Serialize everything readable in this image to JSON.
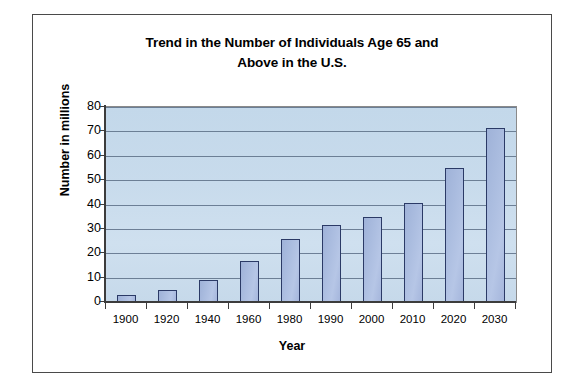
{
  "chart_data": {
    "type": "bar",
    "title": "Trend in the Number of Individuals Age 65 and Above in the U.S.",
    "title_line1": "Trend in the Number of Individuals Age 65 and",
    "title_line2": "Above in the U.S.",
    "xlabel": "Year",
    "ylabel": "Number in millions",
    "categories": [
      "1900",
      "1920",
      "1940",
      "1960",
      "1980",
      "1990",
      "2000",
      "2010",
      "2020",
      "2030"
    ],
    "values": [
      3,
      5,
      9,
      17,
      26,
      31.5,
      35,
      40.5,
      55,
      71.5
    ],
    "ylim": [
      0,
      80
    ],
    "ytick_labels": [
      "0",
      "10",
      "20",
      "30",
      "40",
      "50",
      "60",
      "70",
      "80"
    ],
    "ytick_values": [
      0,
      10,
      20,
      30,
      40,
      50,
      60,
      70,
      80
    ],
    "grid": true,
    "legend": "none",
    "colors": {
      "bar_fill": "#aabcdf",
      "bar_border": "#2b3a66",
      "plot_background": "#c8dbec",
      "gridline": "#5c6f86",
      "axis": "#3c3c3c",
      "text": "#000000",
      "frame_border": "#4a4a4a"
    }
  }
}
